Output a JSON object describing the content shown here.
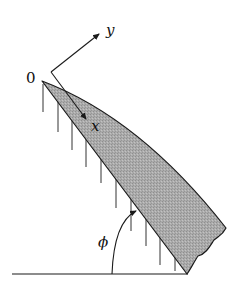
{
  "diagram": {
    "labels": {
      "origin": "0",
      "x_axis": "x",
      "y_axis": "y",
      "angle": "ϕ"
    },
    "colors": {
      "body_fill": "#a9a9a9",
      "stroke": "#1a1a1a",
      "background": "#ffffff"
    },
    "elements": [
      "cantilevered tapered wedge body (shaded)",
      "local x-y coordinate axes at origin 0",
      "vertical hanging lines beneath wedge",
      "ground line",
      "angle arc ϕ from ground to wedge underside"
    ]
  }
}
